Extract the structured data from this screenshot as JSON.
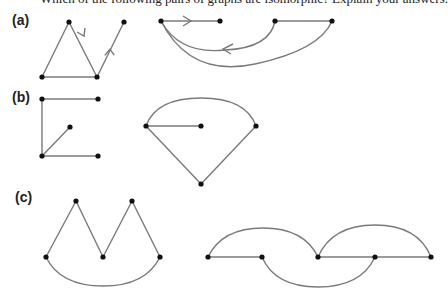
{
  "question": "Which of the following pairs of graphs are isomorphic? Explain your answers.",
  "parts": [
    {
      "label": "(a)"
    },
    {
      "label": "(b)"
    },
    {
      "label": "(c)"
    }
  ],
  "colors": {
    "edge": "#7a7a7a",
    "node": "#111111"
  }
}
